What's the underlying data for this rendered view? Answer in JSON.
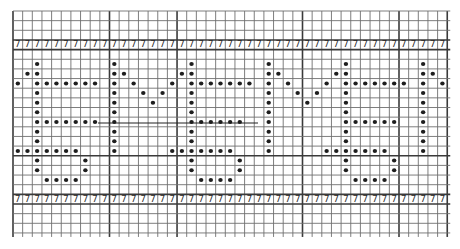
{
  "chart_data": {
    "type": "grid-pattern",
    "title": "",
    "grid": {
      "columns": 45,
      "rows": 23,
      "origin_px": [
        13,
        11
      ],
      "cell_px": 9.65,
      "thick_vertical_at_col": [
        10,
        17,
        30,
        40
      ],
      "thick_horizontal_at_row": [
        3,
        4,
        15,
        19,
        20
      ],
      "line_color": "#6f6f6f",
      "thick_line_color": "#3a3a3a"
    },
    "symbol_rows": [
      {
        "row": 3,
        "symbol": "7",
        "from_col": 0,
        "to_col": 44
      },
      {
        "row": 19,
        "symbol": "7",
        "from_col": 0,
        "to_col": 44
      }
    ],
    "drawn_lines": [
      {
        "row_y_px": 123,
        "x1_px": 98,
        "x2_px": 258
      }
    ],
    "dot_color": "#1e1e1e",
    "dots": [
      [
        5,
        2
      ],
      [
        6,
        2
      ],
      [
        7,
        2
      ],
      [
        8,
        2
      ],
      [
        9,
        2
      ],
      [
        10,
        2
      ],
      [
        11,
        2
      ],
      [
        12,
        2
      ],
      [
        13,
        2
      ],
      [
        14,
        2
      ],
      [
        15,
        2
      ],
      [
        16,
        2
      ],
      [
        6,
        1
      ],
      [
        7,
        0
      ],
      [
        7,
        3
      ],
      [
        7,
        4
      ],
      [
        7,
        5
      ],
      [
        7,
        6
      ],
      [
        7,
        7
      ],
      [
        7,
        8
      ],
      [
        11,
        3
      ],
      [
        11,
        4
      ],
      [
        11,
        5
      ],
      [
        11,
        6
      ],
      [
        11,
        7
      ],
      [
        11,
        8
      ],
      [
        14,
        0
      ],
      [
        14,
        1
      ],
      [
        14,
        3
      ],
      [
        14,
        4
      ],
      [
        14,
        5
      ],
      [
        14,
        6
      ],
      [
        15,
        7
      ],
      [
        16,
        7
      ],
      [
        17,
        3
      ],
      [
        17,
        4
      ],
      [
        17,
        5
      ],
      [
        17,
        6
      ],
      [
        5,
        10
      ],
      [
        6,
        10
      ],
      [
        7,
        10
      ],
      [
        8,
        10
      ],
      [
        9,
        10
      ],
      [
        10,
        10
      ],
      [
        11,
        10
      ],
      [
        12,
        10
      ],
      [
        13,
        10
      ],
      [
        14,
        10
      ],
      [
        6,
        11
      ],
      [
        7,
        12
      ],
      [
        8,
        13
      ],
      [
        9,
        14
      ],
      [
        8,
        15
      ],
      [
        7,
        16
      ],
      [
        6,
        17
      ],
      [
        5,
        18
      ],
      [
        6,
        18
      ],
      [
        7,
        18
      ],
      [
        8,
        18
      ],
      [
        9,
        18
      ],
      [
        10,
        18
      ],
      [
        11,
        18
      ],
      [
        12,
        18
      ],
      [
        13,
        18
      ],
      [
        14,
        18
      ],
      [
        15,
        18
      ],
      [
        16,
        18
      ],
      [
        7,
        19
      ],
      [
        7,
        20
      ],
      [
        7,
        21
      ],
      [
        7,
        22
      ],
      [
        7,
        23
      ],
      [
        7,
        24
      ],
      [
        11,
        19
      ],
      [
        11,
        20
      ],
      [
        11,
        21
      ],
      [
        11,
        22
      ],
      [
        11,
        23
      ],
      [
        14,
        16
      ],
      [
        14,
        17
      ],
      [
        14,
        19
      ],
      [
        14,
        20
      ],
      [
        14,
        21
      ],
      [
        14,
        22
      ],
      [
        15,
        23
      ],
      [
        16,
        23
      ],
      [
        17,
        19
      ],
      [
        17,
        20
      ],
      [
        17,
        21
      ],
      [
        17,
        22
      ],
      [
        5,
        26
      ],
      [
        6,
        26
      ],
      [
        7,
        26
      ],
      [
        8,
        26
      ],
      [
        9,
        26
      ],
      [
        10,
        26
      ],
      [
        11,
        26
      ],
      [
        12,
        26
      ],
      [
        13,
        26
      ],
      [
        14,
        26
      ],
      [
        6,
        27
      ],
      [
        7,
        28
      ],
      [
        8,
        29
      ],
      [
        9,
        30
      ],
      [
        8,
        31
      ],
      [
        7,
        32
      ],
      [
        6,
        33
      ],
      [
        5,
        34
      ],
      [
        6,
        34
      ],
      [
        7,
        34
      ],
      [
        8,
        34
      ],
      [
        9,
        34
      ],
      [
        10,
        34
      ],
      [
        11,
        34
      ],
      [
        12,
        34
      ],
      [
        13,
        34
      ],
      [
        14,
        34
      ],
      [
        15,
        34
      ],
      [
        16,
        34
      ],
      [
        7,
        35
      ],
      [
        7,
        36
      ],
      [
        7,
        37
      ],
      [
        7,
        38
      ],
      [
        7,
        39
      ],
      [
        7,
        40
      ],
      [
        11,
        35
      ],
      [
        11,
        36
      ],
      [
        11,
        37
      ],
      [
        11,
        38
      ],
      [
        11,
        39
      ],
      [
        14,
        32
      ],
      [
        14,
        33
      ],
      [
        14,
        35
      ],
      [
        14,
        36
      ],
      [
        14,
        37
      ],
      [
        14,
        38
      ],
      [
        15,
        39
      ],
      [
        16,
        39
      ],
      [
        17,
        35
      ],
      [
        17,
        36
      ],
      [
        17,
        37
      ],
      [
        17,
        38
      ],
      [
        5,
        42
      ],
      [
        6,
        42
      ],
      [
        7,
        42
      ],
      [
        8,
        42
      ],
      [
        9,
        42
      ],
      [
        10,
        42
      ],
      [
        11,
        42
      ],
      [
        12,
        42
      ],
      [
        13,
        42
      ],
      [
        14,
        42
      ],
      [
        6,
        43
      ],
      [
        7,
        44
      ]
    ],
    "dots_format": "[row, col]"
  }
}
